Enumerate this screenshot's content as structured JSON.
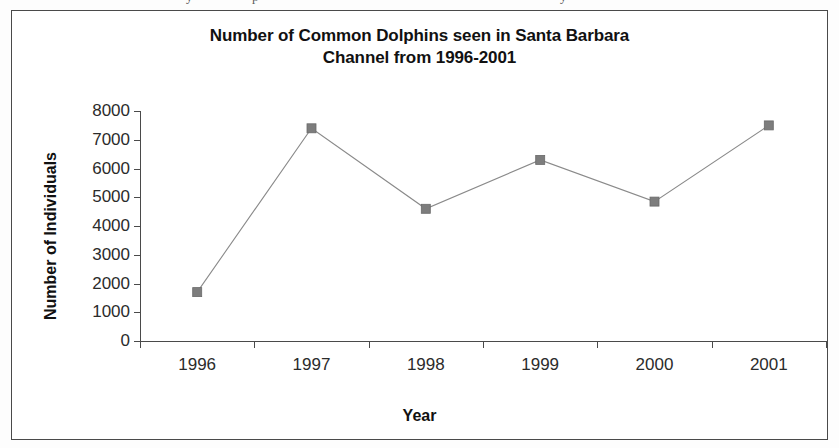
{
  "page": {
    "cutoff_text_fragments": [
      "y",
      "p",
      "y"
    ]
  },
  "chart_data": {
    "type": "line",
    "title": "Number of Common Dolphins seen in Santa Barbara Channel from 1996-2001",
    "title_line1": "Number of Common Dolphins seen in Santa Barbara",
    "title_line2": "Channel from 1996-2001",
    "xlabel": "Year",
    "ylabel": "Number of Individuals",
    "categories": [
      "1996",
      "1997",
      "1998",
      "1999",
      "2000",
      "2001"
    ],
    "values": [
      1700,
      7400,
      4600,
      6300,
      4850,
      7500
    ],
    "ylim": [
      0,
      8000
    ],
    "ytick_labels": [
      "8000",
      "7000",
      "6000",
      "5000",
      "4000",
      "3000",
      "2000",
      "1000",
      "0"
    ],
    "ytick_values": [
      8000,
      7000,
      6000,
      5000,
      4000,
      3000,
      2000,
      1000,
      0
    ],
    "grid": false,
    "legend": "none",
    "series": [
      {
        "name": "Number of Individuals",
        "values": [
          1700,
          7400,
          4600,
          6300,
          4850,
          7500
        ],
        "marker": "square",
        "marker_color": "#7d7d7d",
        "line_color": "#8a8a8a"
      }
    ]
  }
}
